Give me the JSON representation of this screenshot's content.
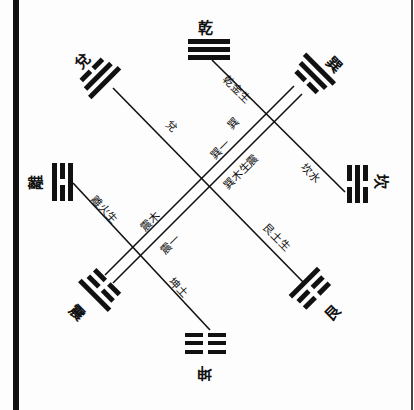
{
  "diagram": {
    "title": "",
    "colors": {
      "ink": "#111111",
      "paper": "#fdfdfd"
    },
    "trigrams": {
      "qian": {
        "name": "乾",
        "position": "top",
        "lines": [
          "solid",
          "solid",
          "solid"
        ]
      },
      "kun": {
        "name": "坤",
        "position": "bottom",
        "lines": [
          "broken",
          "broken",
          "broken"
        ]
      },
      "li": {
        "name": "離",
        "position": "left",
        "lines": [
          "solid",
          "broken",
          "solid"
        ]
      },
      "kan": {
        "name": "坎",
        "position": "right",
        "lines": [
          "broken",
          "solid",
          "broken"
        ]
      },
      "dui": {
        "name": "兌",
        "position": "upper-left",
        "lines": [
          "broken",
          "solid",
          "solid"
        ]
      },
      "xun": {
        "name": "巽",
        "position": "upper-right",
        "lines": [
          "solid",
          "solid",
          "broken"
        ]
      },
      "zhen": {
        "name": "震",
        "position": "lower-left",
        "lines": [
          "broken",
          "broken",
          "solid"
        ]
      },
      "gen": {
        "name": "艮",
        "position": "lower-right",
        "lines": [
          "solid",
          "broken",
          "broken"
        ]
      }
    },
    "line_labels": {
      "qian_kan_upper": "乾金生",
      "qian_kan_lower": "坎水",
      "dui_gen_upper": "兌",
      "dui_gen_lower": "艮土生",
      "li_kun_upper": "離火生",
      "li_kun_lower": "坤土",
      "xun_zhen_upper_a": "巽",
      "xun_zhen_upper_b": "巽木生震",
      "xun_zhen_mid": "巽一",
      "xun_zhen_lower_a": "震木",
      "xun_zhen_lower_b": "震一"
    }
  }
}
